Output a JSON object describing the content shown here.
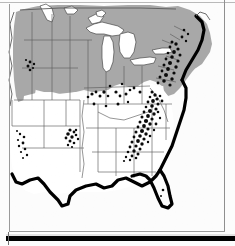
{
  "page": {
    "kind": "scanned-figure-page",
    "figure_type": "thematic-distribution-map",
    "region_depicted": "Eastern and Central United States",
    "background_color": "#fcfcfc"
  },
  "map": {
    "title": "",
    "projection_note": "",
    "colors": {
      "shaded_region_fill": "#a8a8a8",
      "unshaded_region_fill": "#ffffff",
      "lake_fill": "#ffffff",
      "state_border": "#5a5a5a",
      "coastline_heavy": "#000000",
      "stipple_symbol": "#000000",
      "paper": "#fcfcfc"
    },
    "legend_items": [
      {
        "name": "shaded-region",
        "label": "",
        "swatch": "#a8a8a8"
      },
      {
        "name": "unshaded-region",
        "label": "",
        "swatch": "#ffffff"
      },
      {
        "name": "stipple-occurrence",
        "label": "",
        "swatch": "#000000"
      }
    ],
    "shaded_area_description": "Northern tier states, Great Lakes states, New England and Mid-Atlantic shaded gray",
    "unshaded_area_description": "Central plains, Midwest interior and Southern states left white",
    "heavy_coast_description": "Gulf Coast, Florida peninsula and Atlantic seaboard drawn with heavy black outline",
    "stipple_clusters": [
      {
        "name": "appalachian-corridor",
        "density": "dense"
      },
      {
        "name": "new-england-coast",
        "density": "dense"
      },
      {
        "name": "ozark-plateau",
        "density": "moderate"
      },
      {
        "name": "great-lakes-interior",
        "density": "sparse"
      },
      {
        "name": "southern-rockies",
        "density": "sparse"
      },
      {
        "name": "desert-southwest",
        "density": "sparse"
      },
      {
        "name": "florida-peninsula",
        "density": "very-sparse"
      }
    ]
  },
  "frame": {
    "top_rule_color": "#b9b9b9",
    "side_rule_color": "#9a9a9a",
    "bottom_bar_color": "#000000"
  }
}
